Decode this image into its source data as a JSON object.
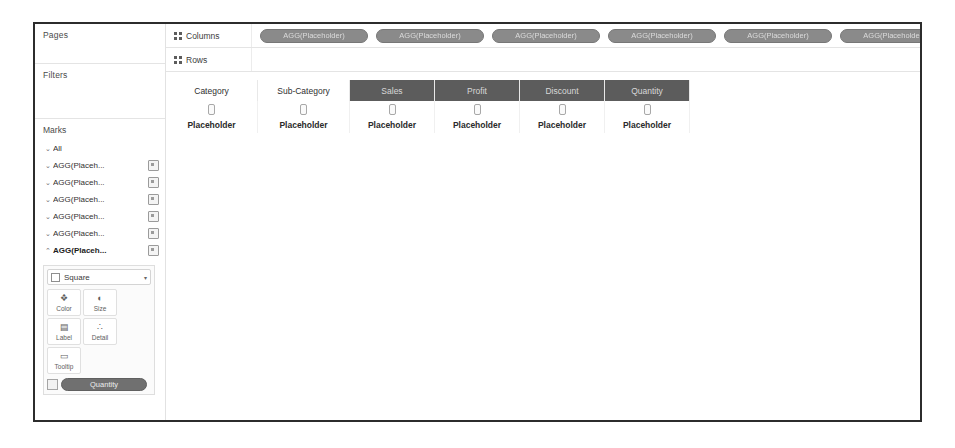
{
  "window": {
    "border_color": "#2c2c2c",
    "background": "#ffffff"
  },
  "sidebar": {
    "pages": {
      "title": "Pages"
    },
    "filters": {
      "title": "Filters"
    },
    "marks": {
      "title": "Marks",
      "all_label": "All",
      "mark_rows": [
        {
          "caret": "⌄",
          "label": "All",
          "has_icon": false
        },
        {
          "caret": "⌄",
          "label": "AGG(Placeh...",
          "has_icon": true
        },
        {
          "caret": "⌄",
          "label": "AGG(Placeh...",
          "has_icon": true
        },
        {
          "caret": "⌄",
          "label": "AGG(Placeh...",
          "has_icon": true
        },
        {
          "caret": "⌄",
          "label": "AGG(Placeh...",
          "has_icon": true
        },
        {
          "caret": "⌄",
          "label": "AGG(Placeh...",
          "has_icon": true
        },
        {
          "caret": "⌃",
          "label": "AGG(Placeh...",
          "has_icon": true
        }
      ],
      "mark_type": {
        "icon": "square-icon",
        "label": "Square",
        "arrow": "▾"
      },
      "buttons": [
        {
          "icon": "color-icon",
          "glyph": "❖",
          "label": "Color"
        },
        {
          "icon": "size-icon",
          "glyph": "◐",
          "label": "Size"
        },
        {
          "icon": "label-icon",
          "glyph": "▤",
          "label": "Label"
        },
        {
          "icon": "detail-icon",
          "glyph": "∴",
          "label": "Detail"
        },
        {
          "icon": "tooltip-icon",
          "glyph": "▭",
          "label": "Tooltip"
        }
      ],
      "legend": {
        "icon": "color-legend-icon",
        "pill_label": "Quantity"
      }
    }
  },
  "shelves": {
    "columns": {
      "icon": "grid-icon",
      "label": "Columns",
      "pills": [
        "AGG(Placeholder)",
        "AGG(Placeholder)",
        "AGG(Placeholder)",
        "AGG(Placeholder)",
        "AGG(Placeholder)",
        "AGG(Placeholder)"
      ]
    },
    "rows": {
      "icon": "grid-icon",
      "label": "Rows",
      "pills": []
    }
  },
  "table": {
    "columns": [
      {
        "header": "Category",
        "dark": false,
        "width": 92,
        "sort": "sort-glyph",
        "placeholder": "Placeholder"
      },
      {
        "header": "Sub-Category",
        "dark": false,
        "width": 92,
        "sort": "sort-glyph",
        "placeholder": "Placeholder"
      },
      {
        "header": "Sales",
        "dark": true,
        "width": 85,
        "sort": "sort-glyph",
        "placeholder": "Placeholder"
      },
      {
        "header": "Profit",
        "dark": true,
        "width": 85,
        "sort": "sort-glyph",
        "placeholder": "Placeholder"
      },
      {
        "header": "Discount",
        "dark": true,
        "width": 85,
        "sort": "sort-glyph",
        "placeholder": "Placeholder"
      },
      {
        "header": "Quantity",
        "dark": true,
        "width": 85,
        "sort": "sort-glyph",
        "placeholder": "Placeholder"
      }
    ]
  },
  "colors": {
    "dark_header": "#5c5c5c",
    "pill_shelf": "#8a8a8a",
    "pill_legend": "#707070",
    "frame": "#2c2c2c",
    "divider": "#e4e4e4"
  }
}
